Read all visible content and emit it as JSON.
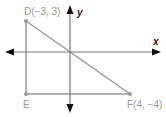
{
  "diagram": {
    "type": "coordinate-plane-triangle",
    "axes": {
      "x_label": "x",
      "y_label": "y",
      "axis_color": "#666666",
      "arrow_color": "#111111"
    },
    "points": [
      {
        "name": "D",
        "label": "D(−3, 3)",
        "x": -3,
        "y": 3
      },
      {
        "name": "E",
        "label": "E",
        "x": -3,
        "y": -4
      },
      {
        "name": "F",
        "label": "F(4, −4)",
        "x": 4,
        "y": -4
      }
    ],
    "segments": [
      {
        "from": "D",
        "to": "E"
      },
      {
        "from": "E",
        "to": "F"
      },
      {
        "from": "D",
        "to": "F"
      }
    ],
    "line_color": "#9a9a9a"
  }
}
